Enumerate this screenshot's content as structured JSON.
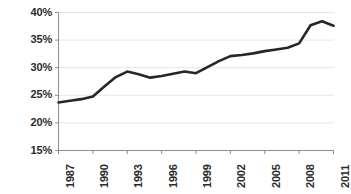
{
  "chart_data": {
    "type": "line",
    "title": "",
    "subtitle": "",
    "xlabel": "",
    "ylabel": "",
    "xlim": [
      1987,
      2011
    ],
    "ylim": [
      15,
      40
    ],
    "ytick_values": [
      40,
      35,
      30,
      25,
      20,
      15
    ],
    "ytick_labels": [
      "40%",
      "35%",
      "30%",
      "25%",
      "20%",
      "15%"
    ],
    "xtick_values": [
      1987,
      1990,
      1993,
      1996,
      1999,
      2002,
      2005,
      2008,
      2011
    ],
    "xtick_labels": [
      "1987",
      "1990",
      "1993",
      "1996",
      "1999",
      "2002",
      "2005",
      "2008",
      "2011"
    ],
    "grid": true,
    "grid_axis": "y",
    "legend": false,
    "legend_position": "none",
    "series": [
      {
        "name": "Share",
        "color": "#262626",
        "x": [
          1987,
          1988,
          1989,
          1990,
          1991,
          1992,
          1993,
          1994,
          1995,
          1996,
          1997,
          1998,
          1999,
          2000,
          2001,
          2002,
          2003,
          2004,
          2005,
          2006,
          2007,
          2008,
          2009,
          2010,
          2011
        ],
        "values": [
          23.7,
          24.0,
          24.3,
          24.8,
          26.6,
          28.3,
          29.3,
          28.8,
          28.2,
          28.5,
          28.9,
          29.3,
          29.0,
          30.1,
          31.2,
          32.1,
          32.3,
          32.6,
          33.0,
          33.3,
          33.6,
          34.4,
          37.7,
          38.4,
          37.6
        ]
      }
    ]
  },
  "colors": {
    "line": "#262626",
    "grid": "#e6e6e6",
    "axis": "#8c8c8c",
    "tick_text": "#2b2b2b",
    "background": "#ffffff"
  }
}
